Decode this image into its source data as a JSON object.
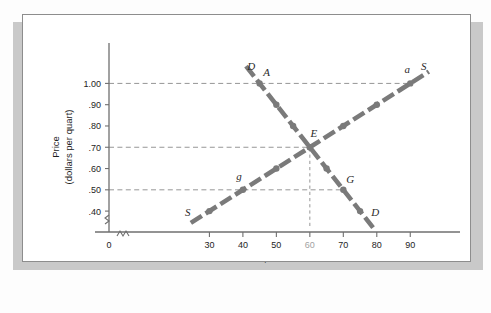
{
  "figure": {
    "colors": {
      "curve": "#7a7a7a",
      "axis": "#6f6f6f",
      "guide": "#8a8a8a",
      "text": "#1d1d1d",
      "muted_tick": "#a2a2a2",
      "frame": "#8d8d8d",
      "shadow": "#c9c9c9",
      "background": "#ffffff"
    }
  },
  "chart_data": {
    "type": "line",
    "title": "",
    "xlabel": "Quantity",
    "xlabel_sub": "(billions of quarts per year)",
    "ylabel": "Price",
    "ylabel_sub": "(dollars per quart)",
    "xlim": [
      0,
      95
    ],
    "ylim": [
      0.33,
      1.11
    ],
    "axis_break_x": true,
    "axis_break_y": true,
    "grid": false,
    "legend": "none",
    "x_ticks": [
      {
        "value": 0,
        "label": "0",
        "muted": false
      },
      {
        "value": 30,
        "label": "30",
        "muted": false
      },
      {
        "value": 40,
        "label": "40",
        "muted": false
      },
      {
        "value": 50,
        "label": "50",
        "muted": false
      },
      {
        "value": 60,
        "label": "60",
        "muted": true
      },
      {
        "value": 70,
        "label": "70",
        "muted": false
      },
      {
        "value": 80,
        "label": "80",
        "muted": false
      },
      {
        "value": 90,
        "label": "90",
        "muted": false
      }
    ],
    "y_ticks": [
      {
        "value": 1.0,
        "label": "1.00"
      },
      {
        "value": 0.9,
        "label": ".90"
      },
      {
        "value": 0.8,
        "label": ".80"
      },
      {
        "value": 0.7,
        "label": ".70"
      },
      {
        "value": 0.6,
        "label": ".60"
      },
      {
        "value": 0.5,
        "label": ".50"
      },
      {
        "value": 0.4,
        "label": ".40"
      }
    ],
    "series": [
      {
        "name": "Demand",
        "curve_label": "D",
        "x": [
          45,
          50,
          55,
          60,
          65,
          70,
          75
        ],
        "values": [
          1.0,
          0.9,
          0.8,
          0.7,
          0.6,
          0.5,
          0.4
        ]
      },
      {
        "name": "Supply",
        "curve_label": "S",
        "x": [
          30,
          40,
          50,
          60,
          70,
          80,
          90
        ],
        "values": [
          0.4,
          0.5,
          0.6,
          0.7,
          0.8,
          0.9,
          1.0
        ]
      }
    ],
    "annotations": [
      {
        "id": "A",
        "label": "A",
        "x": 45,
        "y": 1.0,
        "series": "Demand"
      },
      {
        "id": "E",
        "label": "E",
        "x": 60,
        "y": 0.7,
        "series": "both"
      },
      {
        "id": "G",
        "label": "G",
        "x": 70,
        "y": 0.5,
        "series": "Demand"
      },
      {
        "id": "g",
        "label": "g",
        "x": 40,
        "y": 0.5,
        "series": "Supply"
      },
      {
        "id": "a",
        "label": "a",
        "x": 90,
        "y": 1.0,
        "series": "Supply"
      },
      {
        "id": "D-top",
        "label": "D",
        "x": 42.5,
        "y": 1.065,
        "series": "Demand"
      },
      {
        "id": "D-bottom",
        "label": "D",
        "x": 79.5,
        "y": 0.375,
        "series": "Demand"
      },
      {
        "id": "S-bottom",
        "label": "S",
        "x": 23.5,
        "y": 0.378,
        "series": "Supply"
      },
      {
        "id": "S-top",
        "label": "S",
        "x": 94.0,
        "y": 1.065,
        "series": "Supply"
      }
    ],
    "guide_lines": [
      {
        "price": 1.0,
        "from_q": 0,
        "to_q": 90
      },
      {
        "price": 0.7,
        "from_q": 0,
        "to_q": 60
      },
      {
        "price": 0.5,
        "from_q": 0,
        "to_q": 70
      },
      {
        "quantity": 60,
        "from_p": 0.33,
        "to_p": 0.7
      }
    ]
  }
}
